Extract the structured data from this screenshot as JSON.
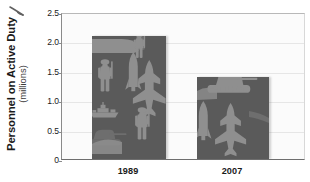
{
  "chart_data": {
    "type": "bar",
    "title": "",
    "xlabel": "",
    "ylabel": "Personnel on Active Duty",
    "ylabel_sub": "(millions)",
    "categories": [
      "1989",
      "2007"
    ],
    "values": [
      2.1,
      1.4
    ],
    "ylim": [
      0,
      2.5
    ],
    "ytick_values": [
      0,
      0.5,
      1.0,
      1.5,
      2.0,
      2.5
    ],
    "ytick_labels": [
      "0",
      "0.5",
      "1.0",
      "1.5",
      "2.0",
      "2.5"
    ],
    "grid": true,
    "legend": "none",
    "series": [
      {
        "name": "Personnel on Active Duty",
        "values": [
          2.1,
          1.4
        ]
      }
    ],
    "bar_fill_style": "military-silhouette-collage",
    "bar_fill_motifs": [
      "soldier",
      "missile",
      "fighter-jet",
      "naval-ship",
      "tank"
    ]
  },
  "colors": {
    "bar_dark": "#5a5a5a",
    "bar_light": "#8f8f8f",
    "bar_mid": "#6e6e6e",
    "plot_background": "#fbfbfb",
    "gridline": "#e6e6e6",
    "axis": "#6e6e6e",
    "text": "#1a1a1a"
  }
}
